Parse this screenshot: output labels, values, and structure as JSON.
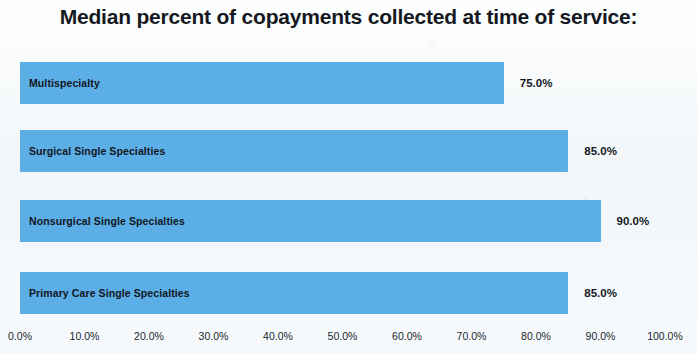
{
  "chart_data": {
    "type": "bar",
    "orientation": "horizontal",
    "title": "Median percent of copayments collected at time of service:",
    "xlabel": "",
    "ylabel": "",
    "xlim": [
      0,
      100
    ],
    "grid": false,
    "legend": false,
    "bar_color": "#5cafe6",
    "categories": [
      "Multispecialty",
      "Surgical Single Specialties",
      "Nonsurgical Single Specialties",
      "Primary Care Single Specialties"
    ],
    "values": [
      75.0,
      85.0,
      90.0,
      85.0
    ],
    "value_labels": [
      "75.0%",
      "85.0%",
      "90.0%",
      "85.0%"
    ],
    "xticks": [
      0,
      10,
      20,
      30,
      40,
      50,
      60,
      70,
      80,
      90,
      100
    ],
    "xtick_labels": [
      "0.0%",
      "10.0%",
      "20.0%",
      "30.0%",
      "40.0%",
      "50.0%",
      "60.0%",
      "70.0%",
      "80.0%",
      "90.0%",
      "100.0%"
    ]
  }
}
